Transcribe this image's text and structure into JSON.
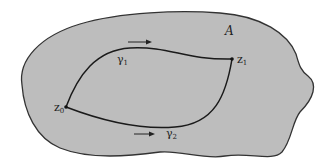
{
  "figure": {
    "region": {
      "label": "A",
      "fill_color": "#bdbdbd",
      "stroke_color": "#333333"
    },
    "points": [
      {
        "id": "z0",
        "base": "z",
        "subscript": "0"
      },
      {
        "id": "z1",
        "base": "z",
        "subscript": "1"
      }
    ],
    "paths": [
      {
        "id": "gamma1",
        "base": "γ",
        "subscript": "1",
        "direction": "left-to-right (upper path)",
        "arrow_glyph": "→"
      },
      {
        "id": "gamma2",
        "base": "γ",
        "subscript": "2",
        "direction": "left-to-right (lower path)",
        "arrow_glyph": "→"
      }
    ],
    "curve_color": "#1a1a1a",
    "background_color": "#ffffff"
  }
}
